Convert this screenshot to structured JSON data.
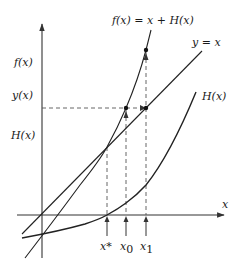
{
  "diagram": {
    "curves": {
      "f": {
        "label": "f(x) = x + H(x)"
      },
      "identity": {
        "label": "y = x"
      },
      "h": {
        "label": "H(x)"
      }
    },
    "axes": {
      "x_label": "x",
      "y_labels": [
        "f(x)",
        "y(x)",
        "H(x)"
      ]
    },
    "markers": {
      "x_star": "x*",
      "x_0": "x",
      "x_0_sub": "0",
      "x_1": "x",
      "x_1_sub": "1"
    }
  }
}
